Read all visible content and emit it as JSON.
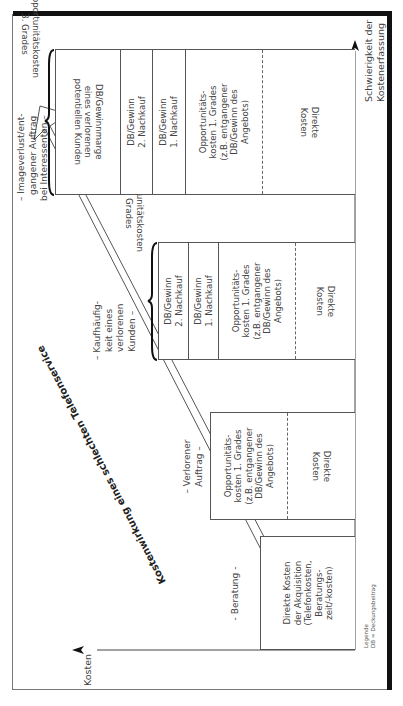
{
  "diagram": {
    "main_arrow_label": "Kostenwirkung eines schlechten Telefonservice",
    "axes": {
      "y_label": "Kosten",
      "x_label_line1": "Schwierigkeit der",
      "x_label_line2": "Kostenerfassung"
    },
    "legend": {
      "title": "Legende",
      "entry": "DB = Deckungsbeitrag"
    },
    "columns": [
      {
        "label_lines": [
          "- Beratung -"
        ],
        "cells": [
          {
            "lines": [
              "Direkte Kosten",
              "der Akquisition",
              "(Telefonkosten,",
              "Beratungs-",
              "zeit/-kosten)"
            ],
            "flipped": false
          }
        ]
      },
      {
        "label_lines": [
          "– Verlorener",
          "Auftrag –"
        ],
        "cells": [
          {
            "lines": [
              "Opportunitäts-",
              "kosten 1. Grades",
              "(z.B. entgangener",
              "DB/Gewinn des",
              "Angebots)"
            ],
            "flipped": false
          },
          {
            "lines": [
              "Direkte",
              "Kosten"
            ],
            "flipped": true
          }
        ]
      },
      {
        "label_lines": [
          "– Kaufhäufig-",
          "keit eines",
          "verlorenen",
          "Kunden –"
        ],
        "brace_label_lines": [
          "Opportunitätskosten",
          "2. Grades"
        ],
        "cells": [
          {
            "lines": [
              "DB/Gewinn",
              "2. Nachkauf"
            ],
            "flipped": false
          },
          {
            "lines": [
              "DB/Gewinn",
              "1. Nachkauf"
            ],
            "flipped": false
          },
          {
            "lines": [
              "Opportunitäts-",
              "kosten 1. Grades",
              "(z.B. entgangener",
              "DB/Gewinn des",
              "Angebots)"
            ],
            "flipped": false
          },
          {
            "lines": [
              "Direkte",
              "Kosten"
            ],
            "flipped": true
          }
        ]
      },
      {
        "label_lines": [
          "– Imageverlust/ent-",
          "gangener Auftrag",
          "bei Interessenten –"
        ],
        "brace_label_lines": [
          "Opportunitätskosten",
          "3. Grades"
        ],
        "cells": [
          {
            "lines": [
              "DB/Gewinnmarge",
              "eines verlorenen",
              "potentiellen Kunden"
            ],
            "flipped": true
          },
          {
            "lines": [
              "DB/Gewinn",
              "2. Nachkauf"
            ],
            "flipped": false
          },
          {
            "lines": [
              "DB/Gewinn",
              "1. Nachkauf"
            ],
            "flipped": false
          },
          {
            "lines": [
              "Opportunitäts-",
              "kosten 1. Grades",
              "(z.B. entgangener",
              "DB/Gewinn des",
              "Angebots)"
            ],
            "flipped": false
          },
          {
            "lines": [
              "Direkte",
              "Kosten"
            ],
            "flipped": true
          }
        ]
      }
    ]
  }
}
